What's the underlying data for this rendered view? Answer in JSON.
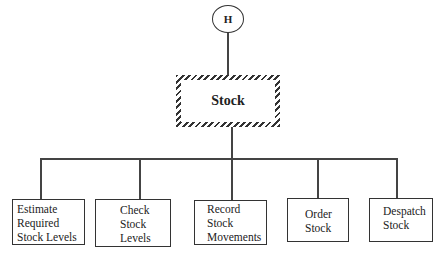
{
  "diagram": {
    "type": "structure-chart",
    "connector": {
      "label": "H",
      "shape": "circle"
    },
    "root": {
      "label": "Stock",
      "border": "hatched"
    },
    "children": [
      {
        "lines": [
          "Estimate",
          "Required",
          "Stock Levels"
        ]
      },
      {
        "lines": [
          "Check",
          "Stock",
          "Levels"
        ]
      },
      {
        "lines": [
          "Record",
          "Stock",
          "Movements"
        ]
      },
      {
        "lines": [
          "Order",
          "Stock"
        ]
      },
      {
        "lines": [
          "Despatch",
          "Stock"
        ]
      }
    ]
  }
}
